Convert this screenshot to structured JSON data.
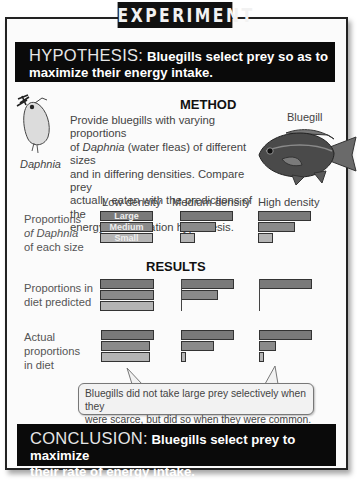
{
  "title": "EXPERIMENT",
  "hypothesis": {
    "label": "HYPOTHESIS:",
    "text_line1": "Bluegills select prey so as to",
    "text_line2": "maximize their energy intake."
  },
  "method": {
    "title": "METHOD",
    "lines": [
      "Provide bluegills with varying proportions",
      "of Daphnia (water fleas) of different sizes",
      "and in differing densities. Compare prey",
      "actually eaten with the predictions of the",
      "energy maximization hypothesis."
    ],
    "daphnia_label": "Daphnia",
    "bluegill_label": "Bluegill"
  },
  "columns": [
    "Low density",
    "Medium density",
    "High density"
  ],
  "row_labels": {
    "proportions": [
      "Proportions",
      "of Daphnia",
      "of each size"
    ],
    "predicted": [
      "Proportions in",
      "diet predicted"
    ],
    "actual": [
      "Actual",
      "proportions",
      "in diet"
    ]
  },
  "size_labels": [
    "Large",
    "Medium",
    "Small"
  ],
  "results_title": "RESULTS",
  "callout": {
    "line1": "Bluegills did not take large prey selectively when they",
    "line2": "were scarce, but did so when they were common."
  },
  "conclusion": {
    "label": "CONCLUSION:",
    "text_line1": "Bluegills select prey to maximize",
    "text_line2": "their rate of energy intake."
  },
  "colors": {
    "dark_box": "#0a0a0a",
    "large_bar": "#7a7a7a",
    "medium_bar": "#8a8a8a",
    "small_bar": "#b4b4b4"
  },
  "chart_data": {
    "type": "bar",
    "orientation": "horizontal",
    "categories": [
      "Large",
      "Medium",
      "Small"
    ],
    "panels": [
      {
        "row": "Proportions of Daphnia of each size",
        "columns": {
          "Low density": [
            1.0,
            1.0,
            1.0
          ],
          "Medium density": [
            1.0,
            0.68,
            0.28
          ],
          "High density": [
            1.0,
            0.68,
            0.28
          ]
        }
      },
      {
        "row": "Proportions in diet predicted",
        "columns": {
          "Low density": [
            1.0,
            1.0,
            1.0
          ],
          "Medium density": [
            1.0,
            0.7,
            0.0
          ],
          "High density": [
            1.0,
            0.0,
            0.0
          ]
        }
      },
      {
        "row": "Actual proportions in diet",
        "columns": {
          "Low density": [
            1.0,
            0.92,
            0.92
          ],
          "Medium density": [
            1.0,
            0.62,
            0.08
          ],
          "High density": [
            1.0,
            0.32,
            0.08
          ]
        }
      }
    ],
    "title": "RESULTS",
    "xlabel": "",
    "ylabel": ""
  }
}
